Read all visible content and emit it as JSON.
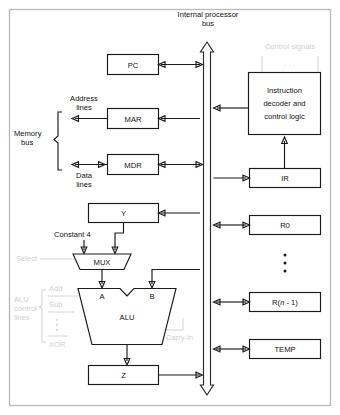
{
  "diagram": {
    "type": "block-diagram",
    "background": "#ffffff",
    "frame_color": "#b9b9b9",
    "line_color": "#1a1a1a",
    "faded_color": "#cfcfcf"
  },
  "bus": {
    "label_line1": "Internal processor",
    "label_line2": "bus",
    "orientation": "vertical",
    "arrowheads": "both",
    "style": "hollow-double-arrow"
  },
  "left_blocks": [
    {
      "id": "pc",
      "label": "PC"
    },
    {
      "id": "mar",
      "label": "MAR"
    },
    {
      "id": "mdr",
      "label": "MDR"
    },
    {
      "id": "y",
      "label": "Y"
    },
    {
      "id": "z",
      "label": "Z"
    }
  ],
  "right_blocks": [
    {
      "id": "decoder",
      "label_line1": "Instruction",
      "label_line2": "decoder and",
      "label_line3": "control logic"
    },
    {
      "id": "ir",
      "label": "IR"
    },
    {
      "id": "r0",
      "label": "R0"
    },
    {
      "id": "rn1",
      "label_pre": "R(",
      "label_italic": "n",
      "label_post": " - 1)"
    },
    {
      "id": "temp",
      "label": "TEMP"
    }
  ],
  "alu": {
    "label": "ALU",
    "input_a": "A",
    "input_b": "B",
    "shape": "trapezoid-notched"
  },
  "mux": {
    "label": "MUX",
    "shape": "trapezoid",
    "constant_label": "Constant 4",
    "select_label": "Select"
  },
  "memory_bus": {
    "bracket_line1": "Memory",
    "bracket_line2": "bus",
    "address_line1": "Address",
    "address_line2": "lines",
    "data_line1": "Data",
    "data_line2": "lines"
  },
  "control_signals": {
    "label": "Control signals",
    "ellipsis": "· · ·"
  },
  "alu_control": {
    "bracket_line1": "ALU",
    "bracket_line2": "control",
    "bracket_line3": "lines",
    "items": [
      "Add",
      "Sub",
      "XOR"
    ],
    "vertical_ellipsis": true,
    "carry_in": "Carry-in"
  },
  "register_ellipsis": {
    "between": "R0 and R(n - 1)",
    "symbol": "vertical-dots"
  }
}
